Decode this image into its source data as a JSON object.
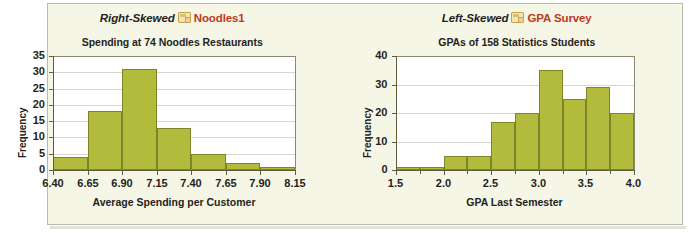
{
  "figure": {
    "background_color": "#f6f6e7",
    "bar_color": "#b3bb3c",
    "bar_border_color": "#7d8429",
    "accent_color": "#c0391b",
    "text_color": "#231f20"
  },
  "charts": [
    {
      "headline": {
        "skew_label": "Right-Skewed",
        "icon": "file-icon",
        "dataset_label": "Noodles1"
      },
      "chart_data": {
        "type": "bar",
        "title": "Spending at 74 Noodles Restaurants",
        "xlabel": "Average Spending per Customer",
        "ylabel": "Frequency",
        "categories": [
          "6.40-6.65",
          "6.65-6.90",
          "6.90-7.15",
          "7.15-7.40",
          "7.40-7.65",
          "7.65-7.90",
          "7.90-8.15"
        ],
        "values": [
          4,
          18,
          31,
          13,
          5,
          2,
          1
        ],
        "bin_edges": [
          6.4,
          6.65,
          6.9,
          7.15,
          7.4,
          7.65,
          7.9,
          8.15
        ],
        "xtick_labels": [
          "6.40",
          "6.65",
          "6.90",
          "7.15",
          "7.40",
          "7.65",
          "7.90",
          "8.15"
        ],
        "ytick_labels": [
          "0",
          "5",
          "10",
          "15",
          "20",
          "25",
          "30",
          "35"
        ],
        "ytick_values": [
          0,
          5,
          10,
          15,
          20,
          25,
          30,
          35
        ],
        "xlim": [
          6.4,
          8.15
        ],
        "ylim": [
          0,
          35
        ],
        "grid": true,
        "legend": "none"
      }
    },
    {
      "headline": {
        "skew_label": "Left-Skewed",
        "icon": "file-icon",
        "dataset_label": "GPA Survey"
      },
      "chart_data": {
        "type": "bar",
        "title": "GPAs of 158 Statistics Students",
        "xlabel": "GPA Last Semester",
        "ylabel": "Frequency",
        "categories": [
          "1.50-1.75",
          "1.75-2.00",
          "2.00-2.25",
          "2.25-2.50",
          "2.50-2.75",
          "2.75-3.00",
          "3.00-3.25",
          "3.25-3.50",
          "3.50-3.75",
          "3.75-4.00"
        ],
        "values": [
          1,
          1,
          5,
          5,
          17,
          20,
          35,
          25,
          29,
          20
        ],
        "bin_edges": [
          1.5,
          1.75,
          2.0,
          2.25,
          2.5,
          2.75,
          3.0,
          3.25,
          3.5,
          3.75,
          4.0
        ],
        "xtick_labels": [
          "1.5",
          "2.0",
          "2.5",
          "3.0",
          "3.5",
          "4.0"
        ],
        "xtick_values": [
          1.5,
          2.0,
          2.5,
          3.0,
          3.5,
          4.0
        ],
        "ytick_labels": [
          "0",
          "10",
          "20",
          "30",
          "40"
        ],
        "ytick_values": [
          0,
          10,
          20,
          30,
          40
        ],
        "xlim": [
          1.5,
          4.0
        ],
        "ylim": [
          0,
          40
        ],
        "grid": true,
        "legend": "none"
      }
    }
  ]
}
